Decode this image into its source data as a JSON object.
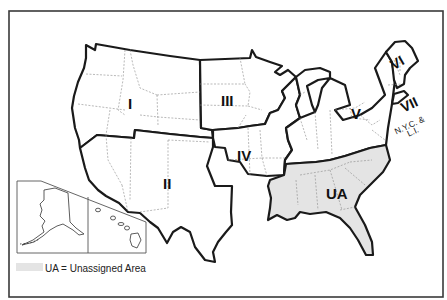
{
  "map": {
    "type": "Administrative region map of the United States",
    "regions": [
      {
        "id": "I",
        "label": "I"
      },
      {
        "id": "II",
        "label": "II"
      },
      {
        "id": "III",
        "label": "III"
      },
      {
        "id": "IV",
        "label": "IV"
      },
      {
        "id": "V",
        "label": "V"
      },
      {
        "id": "VI",
        "label": "VI"
      },
      {
        "id": "VII",
        "label": "VII",
        "sublabel_line1": "N.Y.C. &",
        "sublabel_line2": "L.I."
      },
      {
        "id": "UA",
        "label": "UA"
      }
    ],
    "inset": {
      "panels": [
        "Alaska",
        "Hawaii"
      ]
    },
    "legend": {
      "swatch_color": "#e4e4e4",
      "text": "UA = Unassigned Area"
    },
    "colors": {
      "unassigned_fill": "#e4e4e4",
      "region_border": "#1a1a1a",
      "state_border": "#8a8a8a",
      "background": "#ffffff"
    }
  }
}
